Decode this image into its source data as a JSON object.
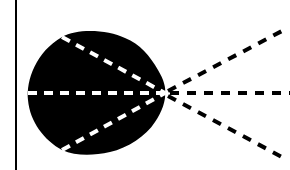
{
  "diagram": {
    "colors": {
      "background": "#ffffff",
      "blob": "#000000",
      "inner_rays": "#ffffff",
      "outer_rays": "#000000",
      "axis_line": "#000000"
    },
    "focal_point": {
      "x": 165,
      "y": 93
    },
    "inner_rays": [
      {
        "name": "upper",
        "from": [
          62,
          37
        ],
        "to": [
          165,
          93
        ]
      },
      {
        "name": "middle",
        "from": [
          28,
          93
        ],
        "to": [
          165,
          93
        ]
      },
      {
        "name": "lower",
        "from": [
          62,
          150
        ],
        "to": [
          165,
          93
        ]
      }
    ],
    "outer_rays": [
      {
        "name": "upper",
        "from": [
          165,
          93
        ],
        "to": [
          282,
          31
        ]
      },
      {
        "name": "middle",
        "from": [
          165,
          93
        ],
        "to": [
          290,
          93
        ]
      },
      {
        "name": "lower",
        "from": [
          165,
          93
        ],
        "to": [
          282,
          157
        ]
      }
    ]
  }
}
